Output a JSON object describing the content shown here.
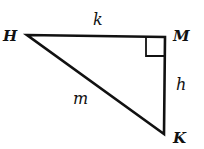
{
  "diagram": {
    "type": "right-triangle",
    "vertices": {
      "H": {
        "label": "H"
      },
      "M": {
        "label": "M"
      },
      "K": {
        "label": "K"
      }
    },
    "sides": {
      "HM": {
        "label": "k"
      },
      "MK": {
        "label": "h"
      },
      "HK": {
        "label": "m"
      }
    },
    "right_angle_at": "M",
    "colors": {
      "stroke": "#111111",
      "background": "#ffffff"
    }
  }
}
